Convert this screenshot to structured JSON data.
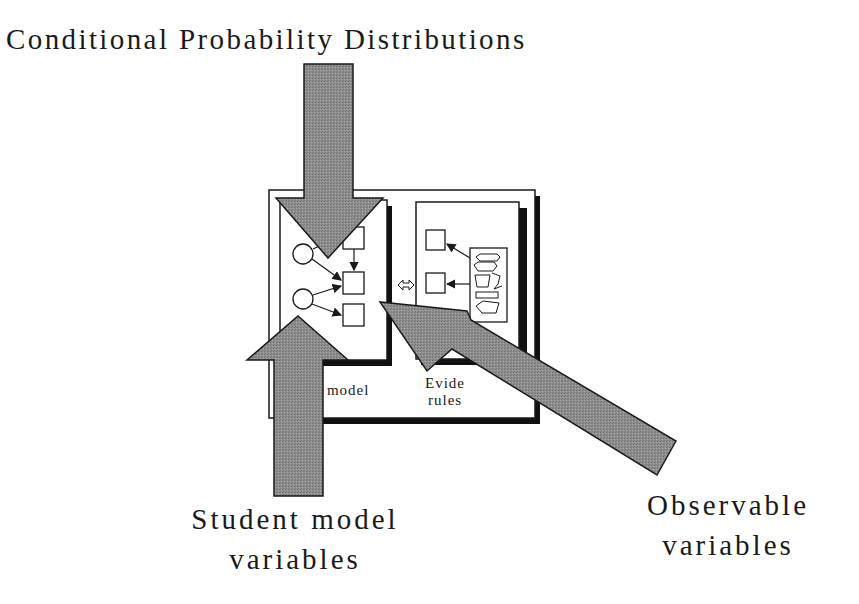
{
  "title": "Conditional Probability Distributions",
  "labels": {
    "student_line1": "Student model",
    "student_line2": "variables",
    "observable_line1": "Observable",
    "observable_line2": "variables"
  },
  "inner_diagram": {
    "left_panel_label": "t model",
    "right_panel_label_line1": "Evide",
    "right_panel_label_line2": "rules"
  },
  "colors": {
    "arrow_fill": "#8c8c8c",
    "stroke": "#1a1a1a",
    "shadow": "#111111",
    "background": "#ffffff"
  }
}
